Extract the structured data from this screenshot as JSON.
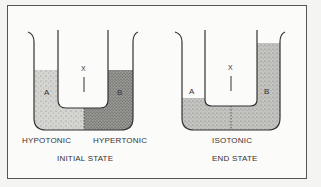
{
  "diagram": {
    "panels": [
      {
        "id": "initial",
        "caption": "INITIAL STATE",
        "membrane_label": "X",
        "left_arm_label": "A",
        "right_arm_label": "B",
        "left_solution": "HYPOTONIC",
        "right_solution": "HYPERTONIC"
      },
      {
        "id": "end",
        "caption": "END STATE",
        "membrane_label": "X",
        "left_arm_label": "A",
        "right_arm_label": "B",
        "solution": "ISOTONIC"
      }
    ],
    "colors": {
      "hypotonic_fill": "#d4d4d0",
      "hypertonic_fill": "#9a9a96",
      "isotonic_fill": "#c4c4c0",
      "outline": "#333333"
    }
  }
}
